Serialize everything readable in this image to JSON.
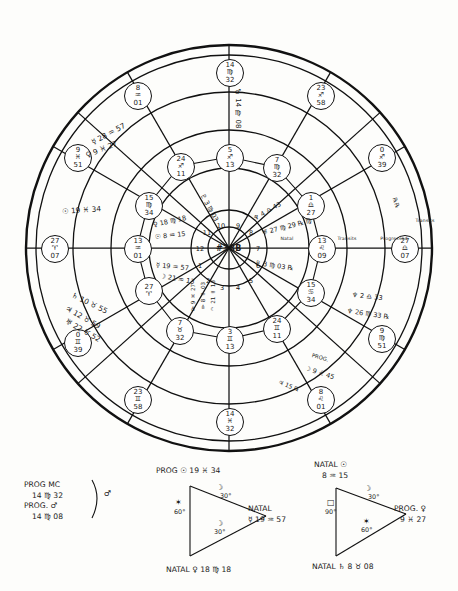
{
  "chart": {
    "title_center": "#38B",
    "ring_labels": [
      {
        "name": "Natal",
        "x": 287,
        "y": 238
      },
      {
        "name": "Transits",
        "x": 347,
        "y": 238
      },
      {
        "name": "Progressed",
        "x": 394,
        "y": 238
      },
      {
        "name": "Transits",
        "x": 425,
        "y": 220
      }
    ],
    "house_numbers": [
      "1",
      "2",
      "3",
      "4",
      "5",
      "6",
      "7",
      "8",
      "9",
      "10",
      "11",
      "12"
    ],
    "cusps": [
      {
        "id": "cusp-asc",
        "deg": "27",
        "sign": "♈",
        "min": "07",
        "x": 54,
        "y": 248
      },
      {
        "id": "cusp-2",
        "deg": "0",
        "sign": "♊",
        "min": "39",
        "x": 77,
        "y": 342
      },
      {
        "id": "cusp-3",
        "deg": "23",
        "sign": "♊",
        "min": "58",
        "x": 137,
        "y": 399
      },
      {
        "id": "cusp-ic",
        "deg": "14",
        "sign": "♓",
        "min": "32",
        "x": 229,
        "y": 421
      },
      {
        "id": "cusp-5",
        "deg": "8",
        "sign": "♌",
        "min": "01",
        "x": 320,
        "y": 399
      },
      {
        "id": "cusp-6",
        "deg": "9",
        "sign": "♍",
        "min": "51",
        "x": 381,
        "y": 338
      },
      {
        "id": "cusp-dsc",
        "deg": "27",
        "sign": "♎",
        "min": "07",
        "x": 404,
        "y": 248
      },
      {
        "id": "cusp-8",
        "deg": "0",
        "sign": "♐",
        "min": "39",
        "x": 381,
        "y": 157
      },
      {
        "id": "cusp-9",
        "deg": "23",
        "sign": "♐",
        "min": "58",
        "x": 320,
        "y": 95
      },
      {
        "id": "cusp-mc",
        "deg": "14",
        "sign": "♍",
        "min": "32",
        "x": 229,
        "y": 72
      },
      {
        "id": "cusp-11",
        "deg": "8",
        "sign": "♒",
        "min": "01",
        "x": 137,
        "y": 95
      },
      {
        "id": "cusp-12",
        "deg": "9",
        "sign": "♓",
        "min": "51",
        "x": 77,
        "y": 157
      }
    ],
    "inner_cusps": [
      {
        "id": "inner-asc",
        "deg": "13",
        "sign": "♒",
        "min": "01",
        "x": 137,
        "y": 248
      },
      {
        "id": "inner-2",
        "deg": "27",
        "sign": "♈",
        "min": "",
        "x": 148,
        "y": 290
      },
      {
        "id": "inner-3",
        "deg": "7",
        "sign": "♉",
        "min": "32",
        "x": 179,
        "y": 330
      },
      {
        "id": "inner-ic",
        "deg": "3",
        "sign": "♊",
        "min": "13",
        "x": 229,
        "y": 339
      },
      {
        "id": "inner-5",
        "deg": "24",
        "sign": "♊",
        "min": "11",
        "x": 276,
        "y": 328
      },
      {
        "id": "inner-6",
        "deg": "15",
        "sign": "♋",
        "min": "34",
        "x": 310,
        "y": 292
      },
      {
        "id": "inner-dsc",
        "deg": "13",
        "sign": "♌",
        "min": "09",
        "x": 321,
        "y": 248
      },
      {
        "id": "inner-8",
        "deg": "1",
        "sign": "♎",
        "min": "27",
        "x": 310,
        "y": 205
      },
      {
        "id": "inner-9",
        "deg": "7",
        "sign": "♍",
        "min": "32",
        "x": 276,
        "y": 167
      },
      {
        "id": "inner-mc",
        "deg": "5",
        "sign": "♐",
        "min": "13",
        "x": 229,
        "y": 157
      },
      {
        "id": "inner-11",
        "deg": "24",
        "sign": "♐",
        "min": "11",
        "x": 180,
        "y": 166
      },
      {
        "id": "inner-12",
        "deg": "15",
        "sign": "♍",
        "min": "34",
        "x": 148,
        "y": 205
      }
    ],
    "planet_notes": [
      {
        "id": "note-mercury-outer",
        "text": "☿ 28 ♒ 57",
        "x": 92,
        "y": 138,
        "rot": -28
      },
      {
        "id": "note-venus-outer",
        "text": "♀ 9 ♓ 27",
        "x": 86,
        "y": 151,
        "rot": -22
      },
      {
        "id": "note-sun-outer",
        "text": "☉ 19 ♓ 34",
        "x": 62,
        "y": 207,
        "rot": -4
      },
      {
        "id": "note-saturn",
        "text": "♄ 10 ♉ 55",
        "x": 72,
        "y": 290,
        "rot": 26
      },
      {
        "id": "note-jupiter",
        "text": "♃ 12 ♉ 59",
        "x": 66,
        "y": 303,
        "rot": 30
      },
      {
        "id": "note-uranus",
        "text": "♅ 22 ♉ 52",
        "x": 66,
        "y": 316,
        "rot": 30
      },
      {
        "id": "note-venus-inner",
        "text": "♀ 18 ♍ 18",
        "x": 153,
        "y": 221,
        "rot": -12
      },
      {
        "id": "note-sun-inner",
        "text": "☉ 8 ♒ 15",
        "x": 155,
        "y": 233,
        "rot": -6
      },
      {
        "id": "note-mercury-inner",
        "text": "☿ 19 ♒ 57",
        "x": 156,
        "y": 261,
        "rot": 6
      },
      {
        "id": "note-moon-inner",
        "text": "☽ 21 ♒ 13",
        "x": 160,
        "y": 272,
        "rot": 10
      },
      {
        "id": "note-mars-top",
        "text": "♂ 14 ♍ 08",
        "x": 234,
        "y": 92,
        "rot": 0
      },
      {
        "id": "note-pluto-top",
        "text": "♇ 3 ♍ 03",
        "x": 202,
        "y": 190,
        "rot": 62
      },
      {
        "id": "note-neptune-right",
        "text": "♆ 4 ♎ 43",
        "x": 254,
        "y": 215,
        "rot": -30
      },
      {
        "id": "note-uranus-right",
        "text": "♅ 27 ♍ 29 ℞ ♍",
        "x": 262,
        "y": 229,
        "rot": -14
      },
      {
        "id": "note-pluto-right",
        "text": "♇ 3 ♍ 03 ℞",
        "x": 255,
        "y": 259,
        "rot": 8
      },
      {
        "id": "note-neptune-low",
        "text": "♆ 2 ♎ 33",
        "x": 352,
        "y": 291,
        "rot": 6
      },
      {
        "id": "note-neptune-low2",
        "text": "♆ 26 ♍ 33 ℞",
        "x": 347,
        "y": 307,
        "rot": 8
      },
      {
        "id": "note-prog-moon",
        "text": "PROG.",
        "x": 312,
        "y": 352,
        "rot": 16
      },
      {
        "id": "note-prog-moon-val",
        "text": "☽ 9 ♌ 45",
        "x": 305,
        "y": 364,
        "rot": 18
      },
      {
        "id": "note-transits-arc",
        "text": "℞℞",
        "x": 395,
        "y": 194,
        "rot": 72
      }
    ],
    "vertical_notes": [
      {
        "id": "vnote-1",
        "text": "♀ 9 ♓ 27",
        "x": 190,
        "y": 285,
        "rot": 76
      },
      {
        "id": "vnote-2",
        "text": "☿ 8 ♒ 03",
        "x": 199,
        "y": 283,
        "rot": 80
      },
      {
        "id": "vnote-3",
        "text": "☽ 21 ♒ 13",
        "x": 209,
        "y": 281,
        "rot": 82
      },
      {
        "id": "vnote-4",
        "text": "♃ 15 ℞",
        "x": 280,
        "y": 378,
        "rot": 22
      }
    ]
  },
  "legend": {
    "prog_mc": {
      "lines": [
        "PROG MC",
        "14 ♍ 32",
        "PROG. ♂",
        "14 ♍ 08"
      ],
      "aspect_symbol": "♂"
    },
    "triangle_center": {
      "title": "PROG ☉ 19 ♓ 34",
      "vertex_right_line1": "NATAL",
      "vertex_right_line2": "☿ 19 ♒ 57",
      "vertex_bottom": "NATAL ♀ 18 ♍ 18",
      "angle_top_symbol": "☽",
      "angle_top": "30°",
      "angle_left_symbol": "✶",
      "angle_left": "60°",
      "angle_diag_symbol": "☽",
      "angle_diag": "30°"
    },
    "triangle_right": {
      "vertex_top_line1": "NATAL ☉",
      "vertex_top_line2": "8 ♒ 15",
      "vertex_right_line1": "PROG. ♀",
      "vertex_right_line2": "9 ♓ 27",
      "vertex_bottom": "NATAL ♄ 8 ♉ 08",
      "angle_top_symbol": "☽",
      "angle_top": "30°",
      "angle_left_symbol": "□",
      "angle_left": "90°",
      "angle_diag_symbol": "✶",
      "angle_diag": "60°"
    }
  }
}
